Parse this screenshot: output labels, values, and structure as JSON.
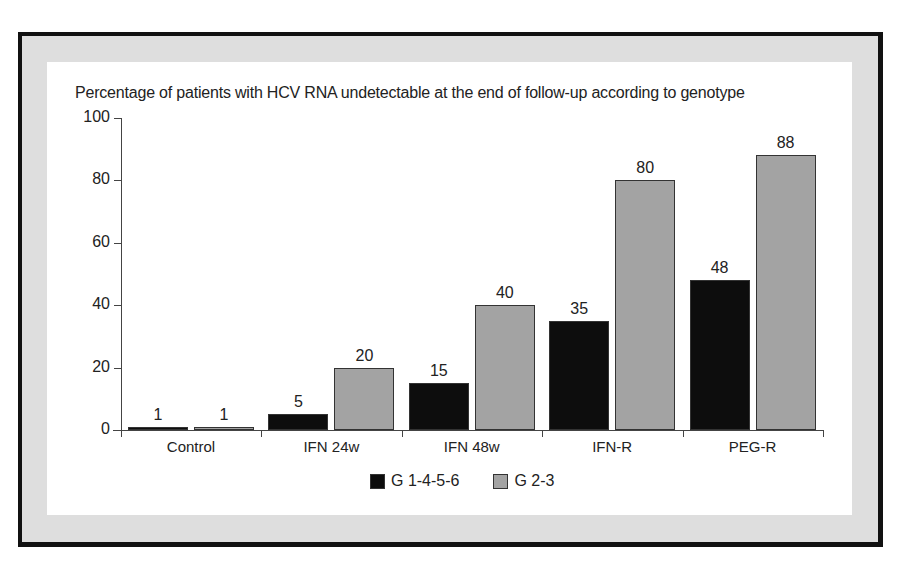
{
  "chart_data": {
    "type": "bar",
    "title": "Percentage of patients with HCV RNA undetectable at the end of follow-up according to genotype",
    "xlabel": "",
    "ylabel": "",
    "ylim": [
      0,
      100
    ],
    "yticks": [
      0,
      20,
      40,
      60,
      80,
      100
    ],
    "categories": [
      "Control",
      "IFN 24w",
      "IFN 48w",
      "IFN-R",
      "PEG-R"
    ],
    "series": [
      {
        "name": "G 1-4-5-6",
        "color": "#0d0d0d",
        "values": [
          1,
          5,
          15,
          35,
          48
        ]
      },
      {
        "name": "G 2-3",
        "color": "#a3a3a3",
        "values": [
          1,
          20,
          40,
          80,
          88
        ]
      }
    ],
    "data_labels": true,
    "grid": false,
    "legend_position": "bottom"
  },
  "colors": {
    "frame_border": "#111111",
    "frame_fill": "#dedede",
    "panel": "#ffffff"
  }
}
